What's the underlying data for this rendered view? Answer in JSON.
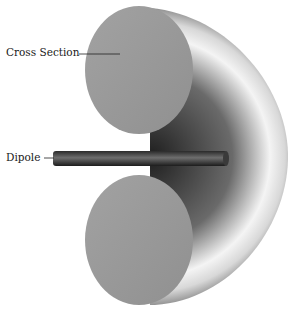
{
  "diagram": {
    "labels": {
      "cross_section": "Cross Section",
      "dipole": "Dipole"
    },
    "colors": {
      "cross_section_face": "#9a9a9a",
      "shell_dark": "#3a3a3a",
      "shell_light": "#f2f2f2",
      "dipole": "#4a4a4a",
      "background": "#ffffff"
    }
  }
}
